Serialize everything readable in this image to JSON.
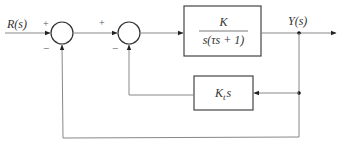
{
  "diagram": {
    "type": "control-system-block-diagram",
    "input_label": "R(s)",
    "output_label": "Y(s)",
    "summing_junctions": [
      {
        "id": "sum1",
        "plus": "+",
        "minus": "−"
      },
      {
        "id": "sum2",
        "plus": "+",
        "minus": "−"
      }
    ],
    "forward_block": {
      "numerator": "K",
      "denominator": "s(τs + 1)"
    },
    "feedback_block": {
      "label_main": "K",
      "label_sub": "t",
      "label_tail": "s"
    },
    "colors": {
      "line": "#777777",
      "block_border": "#444444",
      "text": "#333333"
    }
  }
}
